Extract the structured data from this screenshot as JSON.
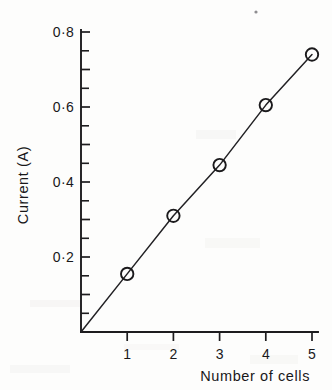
{
  "chart_data": {
    "type": "line",
    "title": "",
    "subtitle": "",
    "xlabel": "Number of cells",
    "ylabel": "Current (A)",
    "x": [
      1,
      2,
      3,
      4,
      5
    ],
    "values": [
      0.155,
      0.31,
      0.445,
      0.605,
      0.74
    ],
    "series": [
      {
        "name": "Current vs number of cells",
        "values": [
          0.155,
          0.31,
          0.445,
          0.605,
          0.74
        ]
      }
    ],
    "xlim": [
      0,
      5.25
    ],
    "ylim": [
      0,
      0.85
    ],
    "x_tick_labels": [
      "1",
      "2",
      "3",
      "4",
      "5"
    ],
    "x_tick_values": [
      1,
      2,
      3,
      4,
      5
    ],
    "y_tick_labels": [
      "0·2",
      "0·4",
      "0·6",
      "0·8"
    ],
    "y_tick_values": [
      0.2,
      0.4,
      0.6,
      0.8
    ],
    "y_minor_tick_values": [
      0.1,
      0.3,
      0.5,
      0.7
    ],
    "grid": false,
    "legend": false,
    "legend_position": "none",
    "marker_style": "open-circle",
    "line_style": "solid",
    "origin_label": "",
    "annotations": []
  },
  "axes": {
    "y_axis_title": "Current (A)",
    "x_axis_title": "Number of cells"
  },
  "ticks": {
    "y": [
      {
        "label": "0·8",
        "value": 0.8
      },
      {
        "label": "0·6",
        "value": 0.6
      },
      {
        "label": "0·4",
        "value": 0.4
      },
      {
        "label": "0·2",
        "value": 0.2
      }
    ],
    "x": [
      {
        "label": "1",
        "value": 1
      },
      {
        "label": "2",
        "value": 2
      },
      {
        "label": "3",
        "value": 3
      },
      {
        "label": "4",
        "value": 4
      },
      {
        "label": "5",
        "value": 5
      }
    ]
  },
  "colors": {
    "ink": "#1d1c1e",
    "background": "#fdfdfc",
    "line": "#222124"
  }
}
